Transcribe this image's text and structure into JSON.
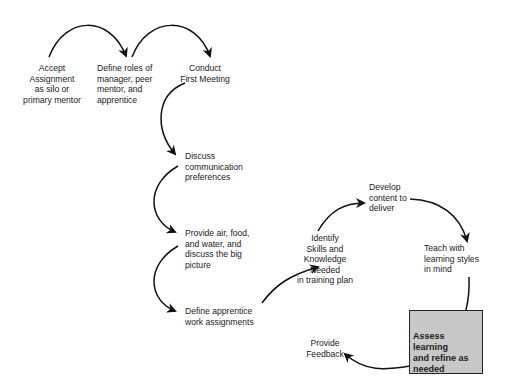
{
  "diagram": {
    "type": "process-flow",
    "steps": [
      {
        "id": "accept",
        "label": "Accept\nAssignment\nas silo or\nprimary mentor"
      },
      {
        "id": "define-roles",
        "label": "Define roles of\nmanager, peer\nmentor, and\napprentice"
      },
      {
        "id": "first-meeting",
        "label": "Conduct\nFirst Meeting"
      },
      {
        "id": "communication",
        "label": "Discuss\ncommunication\npreferences"
      },
      {
        "id": "big-picture",
        "label": "Provide air, food,\nand water, and\ndiscuss the big\npicture"
      },
      {
        "id": "work-assignments",
        "label": "Define apprentice\nwork assignments"
      },
      {
        "id": "identify-skills",
        "label": "Identify\nSkills and\nKnowledge\nNeeded\nin training plan"
      },
      {
        "id": "develop-content",
        "label": "Develop\ncontent to\ndeliver"
      },
      {
        "id": "teach",
        "label": "Teach with\nlearning styles\nin mind"
      },
      {
        "id": "assess",
        "label": "Assess learning\nand refine as\nneeded",
        "highlighted": true,
        "fill": "#c8c8c8"
      },
      {
        "id": "feedback",
        "label": "Provide\nFeedback"
      }
    ],
    "connections": [
      [
        "accept",
        "define-roles"
      ],
      [
        "define-roles",
        "first-meeting"
      ],
      [
        "first-meeting",
        "communication"
      ],
      [
        "communication",
        "big-picture"
      ],
      [
        "big-picture",
        "work-assignments"
      ],
      [
        "work-assignments",
        "identify-skills"
      ],
      [
        "identify-skills",
        "develop-content"
      ],
      [
        "develop-content",
        "teach"
      ],
      [
        "teach",
        "assess"
      ],
      [
        "assess",
        "feedback"
      ]
    ]
  }
}
